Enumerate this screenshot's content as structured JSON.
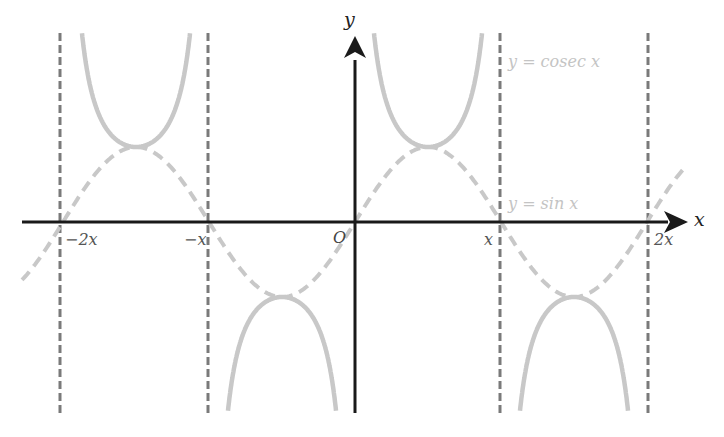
{
  "figure": {
    "axes": {
      "x_label": "x",
      "y_label": "y",
      "origin_label": "O"
    },
    "ticks": [
      {
        "label": "−2x",
        "value": "-2π"
      },
      {
        "label": "−x",
        "value": "-π"
      },
      {
        "label": "x",
        "value": "π"
      },
      {
        "label": "2x",
        "value": "2π"
      }
    ],
    "curves": [
      {
        "name": "cosec",
        "label": "y = cosec x",
        "style": "solid",
        "color": "#c8c8c8"
      },
      {
        "name": "sin",
        "label": "y = sin x",
        "style": "dashed",
        "color": "#c8c8c8"
      }
    ],
    "asymptotes": {
      "positions": [
        "-2π",
        "-π",
        "π",
        "2π"
      ],
      "style": "dashed",
      "color": "#777777"
    },
    "colors": {
      "axis": "#1a1a1a",
      "asymptote": "#777777",
      "curve": "#c8c8c8"
    }
  }
}
